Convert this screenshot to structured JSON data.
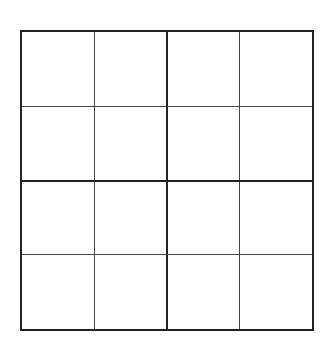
{
  "puzzle": {
    "type": "4x4 sudoku grid",
    "rows": 4,
    "cols": 4,
    "box_rows": 2,
    "box_cols": 2,
    "cells": [
      [
        "",
        "",
        "",
        ""
      ],
      [
        "",
        "",
        "",
        ""
      ],
      [
        "",
        "",
        "",
        ""
      ],
      [
        "",
        "",
        "",
        ""
      ]
    ],
    "line_color": "#222222",
    "background": "#ffffff"
  }
}
